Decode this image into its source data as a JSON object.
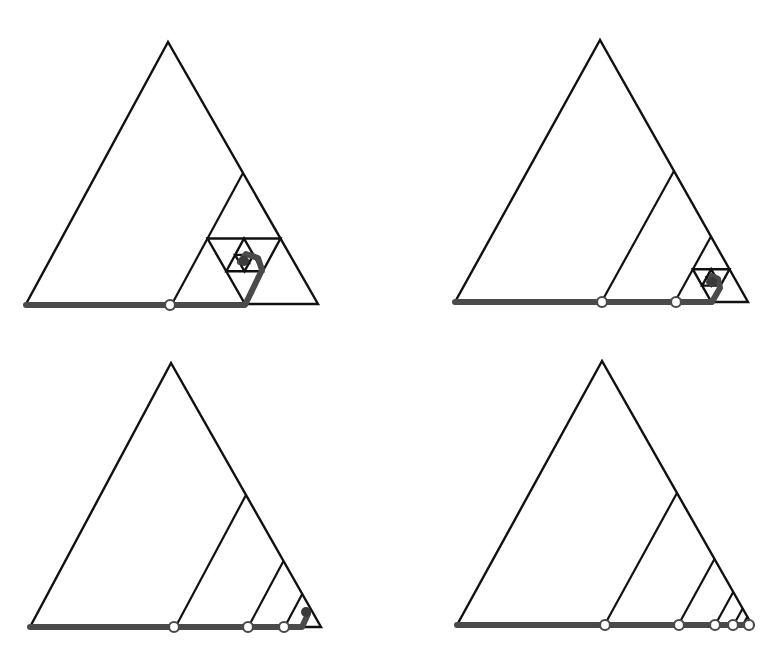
{
  "diagram": {
    "title": "",
    "colors": {
      "background": "#ffffff",
      "outline": "#111111",
      "path": "#4a4a4a",
      "node_fill": "#ffffff"
    },
    "panels": [
      {
        "id": "panel-1",
        "apex": [
          168,
          42
        ],
        "base_left": [
          26,
          304
        ],
        "base_right": [
          318,
          304
        ],
        "ratio": 0.5,
        "mode": "nested-triangles",
        "nested_levels": 4,
        "path_points": [
          [
            26,
            305
          ],
          [
            170,
            305
          ],
          [
            245,
            305
          ],
          [
            262,
            270
          ],
          [
            258,
            258
          ],
          [
            246,
            254
          ],
          [
            240,
            262
          ]
        ],
        "nodes": [
          [
            170,
            305
          ]
        ],
        "spiral_center": [
          244,
          261
        ]
      },
      {
        "id": "panel-2",
        "apex": [
          600,
          40
        ],
        "base_left": [
          455,
          302
        ],
        "base_right": [
          748,
          302
        ],
        "ratio": 0.5,
        "mode": "strips-then-nested",
        "strip_count": 1,
        "nested_levels": 3,
        "path_points": [
          [
            455,
            302
          ],
          [
            602,
            302
          ],
          [
            676,
            302
          ],
          [
            712,
            302
          ],
          [
            720,
            288
          ],
          [
            718,
            279
          ],
          [
            712,
            276
          ],
          [
            709,
            282
          ]
        ],
        "nodes": [
          [
            602,
            302
          ],
          [
            676,
            302
          ]
        ],
        "spiral_center": [
          712,
          282
        ]
      },
      {
        "id": "panel-3",
        "apex": [
          171,
          363
        ],
        "base_left": [
          30,
          627
        ],
        "base_right": [
          321,
          627
        ],
        "ratio": 0.5,
        "mode": "strips-then-blob",
        "strip_count": 3,
        "nested_levels": 0,
        "path_points": [
          [
            30,
            627
          ],
          [
            174,
            627
          ],
          [
            248,
            627
          ],
          [
            284,
            627
          ],
          [
            302,
            627
          ],
          [
            308,
            614
          ]
        ],
        "nodes": [
          [
            174,
            627
          ],
          [
            248,
            627
          ],
          [
            284,
            627
          ]
        ],
        "spiral_center": [
          306,
          612
        ]
      },
      {
        "id": "panel-4",
        "apex": [
          602,
          361
        ],
        "base_left": [
          457,
          625
        ],
        "base_right": [
          752,
          625
        ],
        "ratio": 0.5,
        "mode": "strips-only",
        "strip_count": 5,
        "nested_levels": 0,
        "path_points": [
          [
            457,
            625
          ],
          [
            749,
            625
          ]
        ],
        "nodes": [
          [
            605,
            625
          ],
          [
            679,
            625
          ],
          [
            715,
            625
          ],
          [
            733,
            625
          ],
          [
            749,
            625
          ]
        ],
        "spiral_center": null
      }
    ]
  }
}
